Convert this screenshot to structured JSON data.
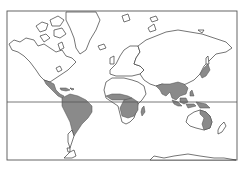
{
  "map": {
    "projection": "mercator",
    "subject": "world outline map with shaded distribution regions",
    "colors": {
      "background": "#ffffff",
      "land": "#ffffff",
      "coastline": "#3a3a3a",
      "shaded_region": "#8a8a8a",
      "frame": "#555555"
    },
    "frame": {
      "x": 7,
      "y": 11,
      "width": 230,
      "height": 149
    },
    "equator": {
      "y": 102,
      "label": ""
    },
    "shaded_regions": [
      "Central America and Mexico",
      "Caribbean",
      "South America (northern and central)",
      "West and Central Africa",
      "East and Southern Africa",
      "Madagascar",
      "India and Southeast Asia",
      "Southern China",
      "Japan",
      "Indonesia and Philippines",
      "New Guinea",
      "Northern and Eastern Australia"
    ],
    "unshaded_landmasses": [
      "North America",
      "Greenland",
      "Europe",
      "Northern Africa",
      "Russia / Northern Asia",
      "Central Australia",
      "New Zealand",
      "Antarctica"
    ]
  }
}
